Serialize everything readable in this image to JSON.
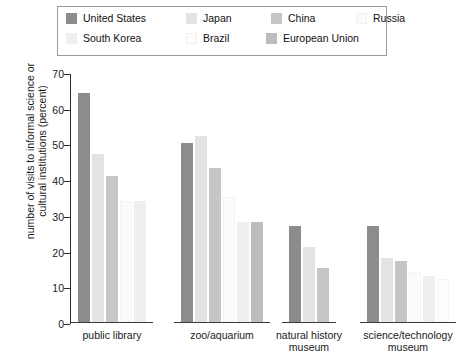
{
  "chart_data": {
    "type": "bar",
    "title": "",
    "xlabel": "",
    "ylabel": "number of visits to informal science\nor cultural institutions (percent)",
    "ylim": [
      0,
      70
    ],
    "yticks": [
      0,
      10,
      20,
      30,
      40,
      50,
      60,
      70
    ],
    "grid": false,
    "legend_position": "top",
    "categories": [
      "public library",
      "zoo/aquarium",
      "natural history\nmuseum",
      "science/technology\nmuseum"
    ],
    "series": [
      {
        "name": "United States",
        "color": "#8c8c8c",
        "values": [
          64,
          50,
          27,
          27
        ]
      },
      {
        "name": "Japan",
        "color": "#e3e3e3",
        "values": [
          47,
          52,
          21,
          18
        ]
      },
      {
        "name": "China",
        "color": "#c6c6c6",
        "values": [
          41,
          43,
          15,
          17
        ]
      },
      {
        "name": "Russia",
        "color": "#fbfbfb",
        "values": [
          34,
          35,
          null,
          14
        ]
      },
      {
        "name": "South Korea",
        "color": "#efefef",
        "values": [
          34,
          28,
          null,
          13
        ]
      },
      {
        "name": "Brazil",
        "color": "#fdfdfd",
        "values": [
          null,
          null,
          null,
          12
        ]
      },
      {
        "name": "European Union",
        "color": "#bdbdbd",
        "values": [
          null,
          28,
          null,
          null
        ]
      }
    ]
  },
  "legend": {
    "rows": [
      [
        "United States",
        "Japan",
        "China",
        "Russia"
      ],
      [
        "South Korea",
        "Brazil",
        "European Union"
      ]
    ]
  }
}
